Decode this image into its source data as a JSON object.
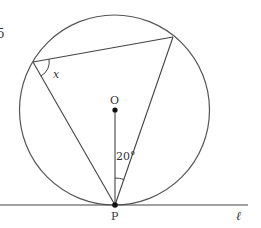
{
  "figure": {
    "corner_fragment": "5",
    "center_label": "O",
    "tangent_point_label": "P",
    "line_label": "ℓ",
    "angle_known": "20°",
    "angle_unknown": "x",
    "colors": {
      "stroke": "#444444",
      "text": "#333333",
      "background": "#ffffff"
    }
  }
}
